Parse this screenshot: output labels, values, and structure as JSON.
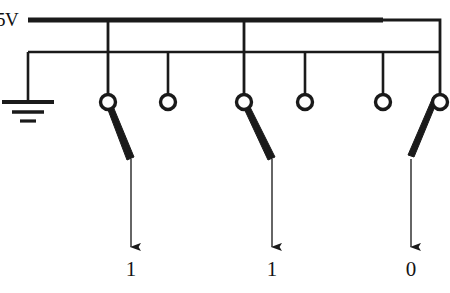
{
  "diagram": {
    "type": "circuit-schematic",
    "colors": {
      "wire": "#1a1a1a",
      "background": "#ffffff",
      "text": "#141414"
    },
    "power_rail": {
      "label": "5V",
      "y": 20,
      "x_start": 28,
      "x_end": 383,
      "stroke_width": 5
    },
    "ground_rail": {
      "label": "",
      "y": 52,
      "x_start": 28,
      "x_end": 440,
      "stroke_width": 2.6
    },
    "ground_symbol": {
      "name": "earth-ground",
      "x": 28,
      "bars": [
        {
          "y": 102,
          "half_width": 26,
          "stroke": 4
        },
        {
          "y": 112,
          "half_width": 16,
          "stroke": 3.5
        },
        {
          "y": 121,
          "half_width": 8,
          "stroke": 3.2
        }
      ]
    },
    "terminals": [
      {
        "name": "terminal-a-in",
        "x": 108,
        "y": 102,
        "r": 7.5,
        "source": "power",
        "drop_from_y": 20
      },
      {
        "name": "terminal-a-out",
        "x": 168,
        "y": 102,
        "r": 7.5,
        "source": "ground",
        "drop_from_y": 52
      },
      {
        "name": "terminal-b-in",
        "x": 244,
        "y": 102,
        "r": 7.5,
        "source": "power",
        "drop_from_y": 20
      },
      {
        "name": "terminal-b-out",
        "x": 305,
        "y": 102,
        "r": 7.5,
        "source": "ground",
        "drop_from_y": 52
      },
      {
        "name": "terminal-c-out",
        "x": 383,
        "y": 102,
        "r": 7.5,
        "source": "ground",
        "drop_from_y": 52
      },
      {
        "name": "terminal-c-in",
        "x": 440,
        "y": 102,
        "r": 7.5,
        "source": "power",
        "drop_from_y": 52
      }
    ],
    "power_drops": [
      {
        "name": "power-drop-a",
        "x": 108,
        "y1": 20,
        "y2": 95
      },
      {
        "name": "power-drop-b",
        "x": 244,
        "y1": 20,
        "y2": 95
      },
      {
        "name": "power-drop-c",
        "x": 383,
        "y1": 20,
        "y2": 52
      }
    ],
    "switches": [
      {
        "name": "switch-a",
        "state": "closed",
        "pivot_x": 108,
        "pivot_y": 100,
        "tip_x": 131,
        "tip_y": 160,
        "direction": "down-right"
      },
      {
        "name": "switch-b",
        "state": "closed",
        "pivot_x": 244,
        "pivot_y": 100,
        "tip_x": 272,
        "tip_y": 160,
        "direction": "down-right"
      },
      {
        "name": "switch-c",
        "state": "closed",
        "pivot_x": 440,
        "pivot_y": 100,
        "tip_x": 411,
        "tip_y": 160,
        "direction": "down-left"
      }
    ],
    "outputs": [
      {
        "name": "output-a",
        "x": 131,
        "arrow_y1": 160,
        "arrow_y2": 248,
        "value": "1"
      },
      {
        "name": "output-b",
        "x": 272,
        "arrow_y1": 160,
        "arrow_y2": 248,
        "value": "1"
      },
      {
        "name": "output-c",
        "x": 411,
        "arrow_y1": 160,
        "arrow_y2": 248,
        "value": "0"
      }
    ]
  }
}
